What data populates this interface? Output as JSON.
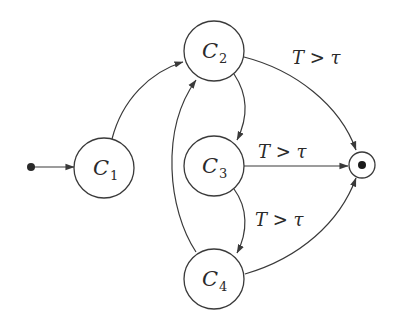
{
  "diagram": {
    "type": "state-machine",
    "colors": {
      "stroke": "#3a3a3a",
      "text": "#2a2a2a",
      "background": "#ffffff"
    },
    "initial": {
      "id": "start"
    },
    "final": {
      "id": "end"
    },
    "nodes": [
      {
        "id": "C1",
        "letter": "C",
        "sub": "1"
      },
      {
        "id": "C2",
        "letter": "C",
        "sub": "2"
      },
      {
        "id": "C3",
        "letter": "C",
        "sub": "3"
      },
      {
        "id": "C4",
        "letter": "C",
        "sub": "4"
      }
    ],
    "edges": [
      {
        "from": "start",
        "to": "C1",
        "label": ""
      },
      {
        "from": "C1",
        "to": "C2",
        "label": ""
      },
      {
        "from": "C2",
        "to": "C3",
        "label": ""
      },
      {
        "from": "C3",
        "to": "C4",
        "label": ""
      },
      {
        "from": "C4",
        "to": "C2",
        "label": ""
      },
      {
        "from": "C2",
        "to": "end",
        "label": "T > τ"
      },
      {
        "from": "C3",
        "to": "end",
        "label": "T > τ"
      },
      {
        "from": "C4",
        "to": "end",
        "label": "T > τ"
      }
    ],
    "labels": {
      "c2_end": {
        "var": "T",
        "op": " > ",
        "thr": "τ"
      },
      "c3_end": {
        "var": "T",
        "op": " > ",
        "thr": "τ"
      },
      "c3_c4": {
        "var": "T",
        "op": " > ",
        "thr": "τ"
      }
    }
  }
}
